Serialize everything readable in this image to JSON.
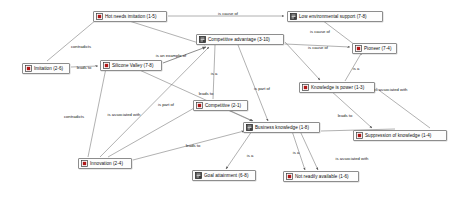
{
  "diagram": {
    "type": "concept-network-map",
    "background": "#ffffff",
    "node_border_color": "#8d8d8d",
    "node_fill_color": "#fdfdfd",
    "edge_color": "#707070",
    "nodes": [
      {
        "id": "hot_needs_imitation",
        "label": "Hot needs imitation (1-5)",
        "icon": "quotation-node-icon",
        "x": 93,
        "y": 11,
        "w": 74
      },
      {
        "id": "low_env_support",
        "label": "Low environmental support (7-8)",
        "icon": "memo-node-icon",
        "x": 287,
        "y": 11,
        "w": 96
      },
      {
        "id": "competitive_adv",
        "label": "Competitive advantage (3-10)",
        "icon": "memo-node-icon",
        "x": 196,
        "y": 34,
        "w": 88
      },
      {
        "id": "pioneer",
        "label": "Pioneer (7-4)",
        "icon": "quotation-node-icon",
        "x": 352,
        "y": 43,
        "w": 45
      },
      {
        "id": "silicone_valley",
        "label": "Silicone Valley (7-8)",
        "icon": "quotation-node-icon",
        "x": 100,
        "y": 60,
        "w": 62
      },
      {
        "id": "imitation",
        "label": "Imitation (2-6)",
        "icon": "quotation-node-icon",
        "x": 22,
        "y": 63,
        "w": 48
      },
      {
        "id": "knowledge_is_power",
        "label": "Knowledge is power (1-3)",
        "icon": "quotation-node-icon",
        "x": 299,
        "y": 82,
        "w": 76
      },
      {
        "id": "competitive",
        "label": "Competitive (2-1)",
        "icon": "quotation-node-icon",
        "x": 193,
        "y": 100,
        "w": 55
      },
      {
        "id": "business_knowledge",
        "label": "Business knowledge (1-8)",
        "icon": "memo-node-icon",
        "x": 243,
        "y": 122,
        "w": 77
      },
      {
        "id": "suppression",
        "label": "Suppression of knowledge (1-4)",
        "icon": "quotation-node-icon",
        "x": 353,
        "y": 130,
        "w": 94
      },
      {
        "id": "innovation",
        "label": "Innovation (2-4)",
        "icon": "quotation-node-icon",
        "x": 78,
        "y": 158,
        "w": 54
      },
      {
        "id": "goal_attainment",
        "label": "Goal attainment (6-8)",
        "icon": "memo-node-icon",
        "x": 192,
        "y": 170,
        "w": 64
      },
      {
        "id": "not_readily_avail",
        "label": "Not readily available (1-6)",
        "icon": "quotation-node-icon",
        "x": 283,
        "y": 171,
        "w": 76
      }
    ],
    "edges": [
      {
        "from": "hot_needs_imitation",
        "to": "low_env_support",
        "label": "is cause of",
        "label_x": 228,
        "label_y": 13,
        "arrow": "end"
      },
      {
        "from": "hot_needs_imitation",
        "to": "imitation",
        "label": "contradicts",
        "label_x": 81,
        "label_y": 46,
        "arrow": "none"
      },
      {
        "from": "hot_needs_imitation",
        "to": "competitive_adv",
        "label": "is an example of",
        "label_x": 171,
        "label_y": 55,
        "arrow": "end"
      },
      {
        "from": "low_env_support",
        "to": "pioneer",
        "label": "is cause of",
        "label_x": 320,
        "label_y": 31,
        "arrow": "end"
      },
      {
        "from": "competitive_adv",
        "to": "knowledge_is_power",
        "label": "is cause of",
        "label_x": 318,
        "label_y": 47,
        "arrow": "end"
      },
      {
        "from": "imitation",
        "to": "silicone_valley",
        "label": "leads to",
        "label_x": 84,
        "label_y": 67,
        "arrow": "end"
      },
      {
        "from": "silicone_valley",
        "to": "competitive_adv",
        "label": "",
        "label_x": 0,
        "label_y": 0,
        "arrow": "end"
      },
      {
        "from": "competitive_adv",
        "to": "competitive",
        "label": "is a",
        "label_x": 214,
        "label_y": 73,
        "arrow": "none"
      },
      {
        "from": "competitive_adv",
        "to": "business_knowledge",
        "label": "is part of",
        "label_x": 262,
        "label_y": 88,
        "arrow": "end"
      },
      {
        "from": "silicone_valley",
        "to": "business_knowledge",
        "label": "",
        "label_x": 0,
        "label_y": 0,
        "arrow": "end"
      },
      {
        "from": "competitive",
        "to": "business_knowledge",
        "label": "leads to",
        "label_x": 206,
        "label_y": 93,
        "arrow": "end"
      },
      {
        "from": "innovation",
        "to": "competitive_adv",
        "label": "is part of",
        "label_x": 166,
        "label_y": 104,
        "arrow": "end"
      },
      {
        "from": "innovation",
        "to": "silicone_valley",
        "label": "contradicts",
        "label_x": 74,
        "label_y": 116,
        "arrow": "none"
      },
      {
        "from": "innovation",
        "to": "competitive",
        "label": "is associated with",
        "label_x": 124,
        "label_y": 114,
        "arrow": "none"
      },
      {
        "from": "innovation",
        "to": "business_knowledge",
        "label": "leads to",
        "label_x": 193,
        "label_y": 145,
        "arrow": "end"
      },
      {
        "from": "knowledge_is_power",
        "to": "pioneer",
        "label": "is a",
        "label_x": 356,
        "label_y": 68,
        "arrow": "end"
      },
      {
        "from": "knowledge_is_power",
        "to": "suppression",
        "label": "is associated with",
        "label_x": 391,
        "label_y": 89,
        "arrow": "none"
      },
      {
        "from": "knowledge_is_power",
        "to": "suppression",
        "label": "leads to",
        "label_x": 345,
        "label_y": 115,
        "arrow": "end"
      },
      {
        "from": "business_knowledge",
        "to": "goal_attainment",
        "label": "is a",
        "label_x": 250,
        "label_y": 155,
        "arrow": "end"
      },
      {
        "from": "business_knowledge",
        "to": "not_readily_avail",
        "label": "is a",
        "label_x": 296,
        "label_y": 152,
        "arrow": "end"
      },
      {
        "from": "business_knowledge",
        "to": "suppression",
        "label": "is associated with",
        "label_x": 352,
        "label_y": 158,
        "arrow": "none"
      }
    ]
  }
}
